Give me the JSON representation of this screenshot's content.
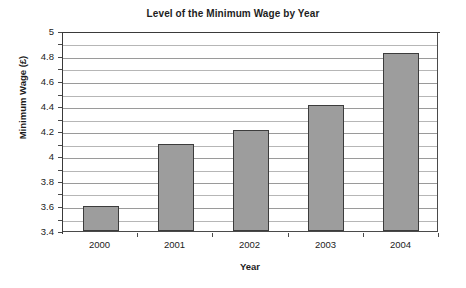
{
  "chart_data": {
    "type": "bar",
    "title": "Level of the Minimum Wage by Year",
    "xlabel": "Year",
    "ylabel": "Minimum Wage (£)",
    "categories": [
      "2000",
      "2001",
      "2002",
      "2003",
      "2004"
    ],
    "values": [
      3.6,
      4.1,
      4.21,
      4.41,
      4.82
    ],
    "ylim": [
      3.4,
      5
    ],
    "ytick_step": 0.2,
    "gridline_step": 0.1,
    "ytick_labels": [
      "5",
      "4.8",
      "4.6",
      "4.4",
      "4.2",
      "4",
      "3.8",
      "3.6",
      "3.4"
    ],
    "ytick_values": [
      5,
      4.8,
      4.6,
      4.4,
      4.2,
      4,
      3.8,
      3.6,
      3.4
    ],
    "grid": true,
    "grid_axis": "y",
    "legend": false,
    "legend_position": "none",
    "series": [
      {
        "name": "Minimum Wage",
        "values": [
          3.6,
          4.1,
          4.21,
          4.41,
          4.82
        ]
      }
    ],
    "colors": {
      "bar_fill": "#9d9d9d",
      "bar_border": "#3c3c3c",
      "gridline": "#b6b6b6",
      "axis": "#4a4a4a",
      "background": "#ffffff",
      "text": "#1d1d1d"
    }
  }
}
